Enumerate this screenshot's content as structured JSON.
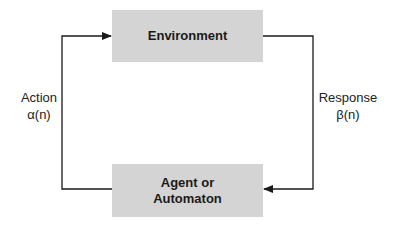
{
  "diagram": {
    "nodes": {
      "environment": {
        "label": "Environment"
      },
      "agent": {
        "label_line1": "Agent or",
        "label_line2": "Automaton"
      }
    },
    "edges": {
      "action": {
        "label_line1": "Action",
        "label_line2": "α(n)",
        "from": "agent",
        "to": "environment"
      },
      "response": {
        "label_line1": "Response",
        "label_line2": "β(n)",
        "from": "environment",
        "to": "agent"
      }
    },
    "colors": {
      "box_fill": "#d4d4d4",
      "line": "#1a1a1a",
      "text": "#1a1a1a"
    }
  }
}
